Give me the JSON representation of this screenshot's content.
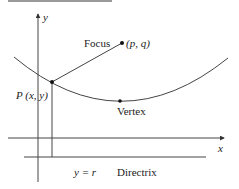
{
  "diagram": {
    "axes": {
      "x_label": "x",
      "y_label": "y"
    },
    "points": {
      "focus": {
        "label": "Focus",
        "coord_label": "(p, q)"
      },
      "vertex": {
        "label": "Vertex"
      },
      "point_p": {
        "label": "P (x, y)"
      }
    },
    "directrix": {
      "equation": "y = r",
      "label": "Directrix"
    },
    "colors": {
      "line": "#333333",
      "curve": "#444444",
      "text": "#222222",
      "background": "#ffffff"
    }
  }
}
